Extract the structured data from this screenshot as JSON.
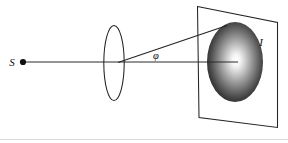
{
  "figure": {
    "type": "optics-ray-diagram",
    "caption": "",
    "width": 288,
    "height": 143,
    "background_color": "#ffffff",
    "stroke_color": "#1a1a1a",
    "labels": {
      "source": "S",
      "image": "I",
      "angle": "φ"
    },
    "elements": {
      "point_source": {
        "name": "point-source-S",
        "x": 23,
        "y": 62,
        "radius": 3.1,
        "fill": "#101010",
        "label": "S",
        "label_x": 12,
        "label_y": 66
      },
      "optical_axis": {
        "name": "optical-axis",
        "x1": 23,
        "y1": 62,
        "x2": 238,
        "y2": 62,
        "stroke_width": 1.05,
        "stroke": "#2a2a2a"
      },
      "lens": {
        "name": "converging-lens",
        "cx": 114,
        "cy": 63,
        "rx": 10.2,
        "ry": 37.5,
        "stroke_width": 1.05,
        "stroke": "#232323",
        "fill": "none"
      },
      "marginal_ray": {
        "name": "marginal-ray",
        "x1": 118,
        "y1": 62.5,
        "x2": 227,
        "y2": 25.5,
        "stroke_width": 1.05,
        "stroke": "#232323"
      },
      "angle_label": {
        "name": "angle-phi",
        "text": "φ",
        "x": 156,
        "y": 59
      },
      "screen_plane": {
        "name": "screen-plane",
        "points": "197.5,6.5 277.5,22.5 277.5,127.5 199,117.5",
        "stroke_width": 1.05,
        "stroke": "#242424",
        "fill": "none"
      },
      "blur_spot": {
        "name": "blur-spot",
        "cx": 235,
        "cy": 62,
        "rx": 28,
        "ry": 40,
        "center_color": "#ffffff",
        "mid_color": "#8a8a8a",
        "edge_color": "#161616",
        "highlight_x": 238,
        "highlight_y": 60
      },
      "image_label": {
        "name": "image-label-I",
        "text": "I",
        "x": 261,
        "y": 46
      },
      "baseline_rule": {
        "name": "bottom-rule",
        "x1": 0,
        "y1": 139.5,
        "x2": 288,
        "y2": 139.5,
        "stroke": "#d7d7d7",
        "stroke_width": 1
      }
    }
  }
}
